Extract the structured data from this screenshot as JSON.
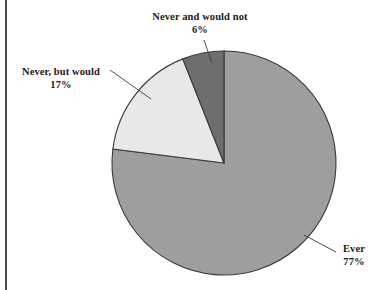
{
  "figure": {
    "title": "",
    "background_color": "#ffffff",
    "rule_color": "#4a4a4a"
  },
  "labels": {
    "never_and_would_not": {
      "name": "Never and would not",
      "percent": "6%"
    },
    "never_but_would": {
      "name": "Never, but would",
      "percent": "17%"
    },
    "ever": {
      "name": "Ever",
      "percent": "77%"
    }
  },
  "chart_data": {
    "type": "pie",
    "title": "",
    "xlabel": "",
    "ylabel": "",
    "legend_position": "none",
    "grid": false,
    "labels": [
      "Ever",
      "Never, but would",
      "Never and would not"
    ],
    "values": [
      77,
      17,
      6
    ],
    "value_labels": [
      "77%",
      "17%",
      "6%"
    ],
    "units": "percent",
    "total": 100,
    "start_angle_deg": 90,
    "direction": "clockwise",
    "colors": [
      "#9e9e9e",
      "#e8e8e8",
      "#6e6e6e"
    ],
    "slice_border_color": "#3a3a3a",
    "center_px": [
      224,
      163
    ],
    "radius_px": 112,
    "slices": [
      {
        "label": "Ever",
        "value": 77,
        "value_label": "77%",
        "color": "#9e9e9e",
        "sweep_deg": 277.2
      },
      {
        "label": "Never, but would",
        "value": 17,
        "value_label": "17%",
        "color": "#e8e8e8",
        "sweep_deg": 61.2
      },
      {
        "label": "Never and would not",
        "value": 6,
        "value_label": "6%",
        "color": "#6e6e6e",
        "sweep_deg": 21.6
      }
    ]
  }
}
